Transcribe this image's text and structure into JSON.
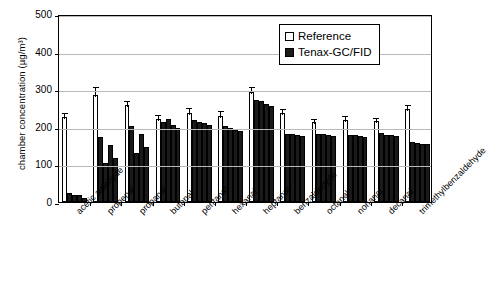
{
  "chart_data": {
    "type": "bar",
    "title": "",
    "xlabel": "",
    "ylabel": "chamber concentration (µg/m³)",
    "ylim": [
      0,
      500
    ],
    "yticks": [
      0,
      100,
      200,
      300,
      400,
      500
    ],
    "grid": true,
    "legend_position": "top-right",
    "legend": [
      "Reference",
      "Tenax-GC/FID"
    ],
    "categories": [
      "acetic aldehyde",
      "propenal",
      "propanal",
      "butanal",
      "pentanal",
      "hexanal",
      "heptanal",
      "benzaldehyde",
      "octanal",
      "nonanal",
      "decanal",
      "trimethylbenzaldehyde"
    ],
    "series": [
      {
        "name": "Reference",
        "values": [
          225,
          285,
          257,
          222,
          238,
          230,
          293,
          237,
          213,
          218,
          216,
          248
        ],
        "errors": [
          18,
          25,
          16,
          14,
          18,
          18,
          17,
          16,
          14,
          16,
          14,
          16
        ]
      },
      {
        "name": "Tenax-GC/FID",
        "replicates": [
          [
            25,
            18,
            18,
            10
          ],
          [
            172,
            105,
            152,
            118
          ],
          [
            203,
            130,
            182,
            146
          ],
          [
            212,
            220,
            206,
            198
          ],
          [
            219,
            214,
            209,
            204
          ],
          [
            203,
            196,
            191,
            188
          ],
          [
            272,
            268,
            262,
            255
          ],
          [
            182,
            180,
            179,
            176
          ],
          [
            181,
            180,
            178,
            175
          ],
          [
            177,
            177,
            176,
            174
          ],
          [
            183,
            179,
            177,
            176
          ],
          [
            160,
            157,
            155,
            153
          ]
        ]
      }
    ]
  },
  "axes": {
    "ytick_labels": [
      "500",
      "400",
      "300",
      "200",
      "100",
      "0"
    ],
    "y_axis_title": "chamber concentration (µg/m³)"
  },
  "legend": {
    "reference_label": "Reference",
    "tenax_label": "Tenax-GC/FID"
  }
}
